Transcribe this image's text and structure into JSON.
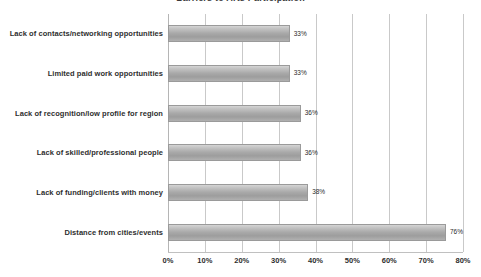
{
  "chart_data": {
    "type": "bar",
    "orientation": "horizontal",
    "title": "Barriers to Arts Participation",
    "xlabel": "",
    "ylabel": "",
    "categories": [
      "Lack of contacts/networking opportunities",
      "Limited paid work opportunities",
      "Lack of recognition/low profile for region",
      "Lack of skilled/professional people",
      "Lack of funding/clients with money",
      "Distance from cities/events"
    ],
    "values": [
      33,
      33,
      36,
      36,
      38,
      76
    ],
    "data_labels": [
      "33%",
      "33%",
      "36%",
      "36%",
      "38%",
      "76%"
    ],
    "xlim": [
      0,
      80
    ],
    "xtick_values": [
      0,
      10,
      20,
      30,
      40,
      50,
      60,
      70,
      80
    ],
    "xtick_labels": [
      "0%",
      "10%",
      "20%",
      "30%",
      "40%",
      "50%",
      "60%",
      "70%",
      "80%"
    ],
    "grid": true,
    "grid_axis": "x",
    "legend": false,
    "bar_color": "#a9a9a9",
    "grid_color": "#c9c9c9",
    "text_color": "#2e2e2e"
  }
}
